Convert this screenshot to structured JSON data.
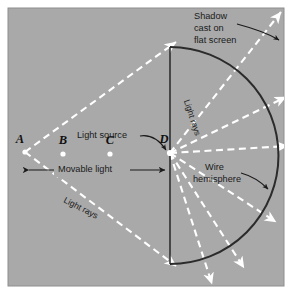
{
  "figure": {
    "panel": {
      "background_color": "#a9a9a9",
      "border_color": "#8f8f8f",
      "page_background": "#ffffff",
      "x": 8,
      "y": 8,
      "width": 276,
      "height": 278
    },
    "colors": {
      "ray": "#ffffff",
      "ink": "#1a1a1a",
      "arc": "#2b2b2b",
      "screen_line": "#1f1f1f",
      "point_dot": "#ffffff"
    }
  },
  "labels": {
    "shadow_cast": [
      "Shadow",
      "cast on",
      "flat screen"
    ],
    "light_source": "Light source",
    "movable_light": "Movable light",
    "wire_hemisphere": [
      "Wire",
      "hemisphere"
    ],
    "light_rays_upper": "Light rays",
    "light_rays_lower": "Light rays"
  },
  "points": [
    {
      "id": "A",
      "label": "A",
      "x": 25,
      "y": 152,
      "has_dot": true,
      "label_x": 20,
      "label_y": 140
    },
    {
      "id": "B",
      "label": "B",
      "x": 63,
      "y": 154,
      "has_dot": true,
      "label_x": 63,
      "label_y": 141
    },
    {
      "id": "C",
      "label": "C",
      "x": 110,
      "y": 154,
      "has_dot": true,
      "label_x": 110,
      "label_y": 141
    },
    {
      "id": "D",
      "label": "D",
      "x": 170,
      "y": 153,
      "has_dot": true,
      "label_x": 164,
      "label_y": 140
    }
  ],
  "geometry": {
    "hemisphere": {
      "center_x": 170,
      "center_y": 153,
      "radius": 108,
      "description": "semicircular arc opening to the right from the vertical screen line"
    },
    "flat_screen_line": {
      "x": 170,
      "y_top": 47,
      "y_bottom": 264
    },
    "rays_from_A": [
      {
        "from": [
          25,
          152
        ],
        "to": [
          170,
          47
        ]
      },
      {
        "from": [
          25,
          152
        ],
        "to": [
          170,
          262
        ]
      }
    ],
    "rays_from_D_angles_deg": [
      -56,
      -32,
      -8,
      16,
      40,
      62
    ],
    "movable_light_arrow": {
      "x_start": 28,
      "x_end": 166,
      "y": 170
    }
  },
  "annotations": {
    "shadow_leader": "curved leader from 'Shadow cast on flat screen' text to upper-right screen edge",
    "light_source_leader": "curved leader from 'Light source' text to point D",
    "wire_hemisphere_leader": "curved leader from 'Wire hemisphere' text to the arc"
  }
}
